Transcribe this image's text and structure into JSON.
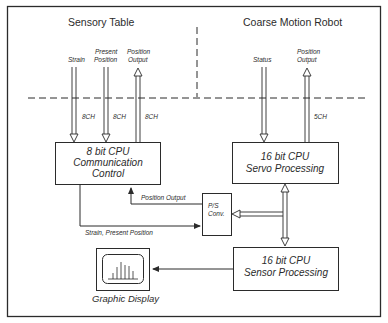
{
  "regions": {
    "left_title": "Sensory Table",
    "right_title": "Coarse Motion Robot"
  },
  "signals": {
    "strain": "Strain",
    "present_position": [
      "Present",
      "Position"
    ],
    "position_output_left": [
      "Position",
      "Output"
    ],
    "status": "Status",
    "position_output_right": [
      "Position",
      "Output"
    ]
  },
  "channels": {
    "strain_ch": "8CH",
    "present_ch": "8CH",
    "output_ch": "8CH",
    "robot_ch": "5CH"
  },
  "blocks": {
    "comm_cpu": [
      "8 bit CPU",
      "Communication",
      "Control"
    ],
    "servo_cpu": [
      "16 bit CPU",
      "Servo Processing"
    ],
    "sensor_cpu": [
      "16 bit CPU",
      "Sensor Processing"
    ],
    "ps_conv": [
      "P/S",
      "Conv."
    ],
    "graphic_display": "Graphic Display"
  },
  "links": {
    "position_output": "Position Output",
    "strain_present": "Strain, Present Position"
  },
  "colors": {
    "line": "#2b2b2b",
    "background": "#ffffff"
  }
}
